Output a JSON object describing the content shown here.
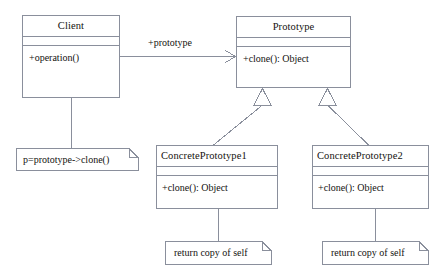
{
  "diagram": {
    "kind": "uml-class-diagram",
    "stroke_color": "#8a8f9c",
    "fill_color": "#ffffff",
    "text_color": "#14120f",
    "background_color": "#ffffff"
  },
  "classes": [
    {
      "id": "client",
      "name": "Client",
      "title_align": "center",
      "attributes": [],
      "operations": [
        "+operation()"
      ]
    },
    {
      "id": "prototype",
      "name": "Prototype",
      "title_align": "center",
      "attributes": [],
      "operations": [
        "+clone(): Object"
      ]
    },
    {
      "id": "concrete1",
      "name": "ConcretePrototype1",
      "title_align": "left",
      "attributes": [],
      "operations": [
        "+clone(): Object"
      ]
    },
    {
      "id": "concrete2",
      "name": "ConcretePrototype2",
      "title_align": "left",
      "attributes": [],
      "operations": [
        "+clone(): Object"
      ]
    }
  ],
  "associations": [
    {
      "id": "client-prototype",
      "from": "client",
      "to": "prototype",
      "role_label": "+prototype",
      "arrow": "open-arrow"
    }
  ],
  "generalizations": [
    {
      "id": "gen-1",
      "from": "concrete1",
      "to": "prototype",
      "arrow": "hollow-triangle"
    },
    {
      "id": "gen-2",
      "from": "concrete2",
      "to": "prototype",
      "arrow": "hollow-triangle"
    }
  ],
  "notes": [
    {
      "id": "note-client",
      "text": "p=prototype->clone()",
      "anchor": "client"
    },
    {
      "id": "note-concrete1",
      "text": "return copy of self",
      "anchor": "concrete1"
    },
    {
      "id": "note-concrete2",
      "text": "return copy of self",
      "anchor": "concrete2"
    }
  ]
}
